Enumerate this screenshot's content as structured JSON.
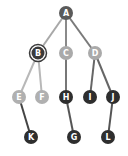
{
  "diagram": {
    "type": "tree",
    "nodes": [
      {
        "id": "A",
        "label": "A",
        "x": 66,
        "y": 13,
        "fill": "#5a5a5a",
        "ring": false
      },
      {
        "id": "B",
        "label": "B",
        "x": 38,
        "y": 53,
        "fill": "#3a3a3a",
        "ring": true
      },
      {
        "id": "C",
        "label": "C",
        "x": 66,
        "y": 53,
        "fill": "#aaaaaa",
        "ring": false
      },
      {
        "id": "D",
        "label": "D",
        "x": 95,
        "y": 53,
        "fill": "#aaaaaa",
        "ring": false
      },
      {
        "id": "E",
        "label": "E",
        "x": 19,
        "y": 97,
        "fill": "#b0b0b0",
        "ring": false
      },
      {
        "id": "F",
        "label": "F",
        "x": 42,
        "y": 97,
        "fill": "#b0b0b0",
        "ring": false
      },
      {
        "id": "H",
        "label": "H",
        "x": 66,
        "y": 97,
        "fill": "#2e2e2e",
        "ring": false
      },
      {
        "id": "I",
        "label": "I",
        "x": 90,
        "y": 97,
        "fill": "#2e2e2e",
        "ring": false
      },
      {
        "id": "J",
        "label": "J",
        "x": 113,
        "y": 97,
        "fill": "#2e2e2e",
        "ring": false
      },
      {
        "id": "K",
        "label": "K",
        "x": 31,
        "y": 137,
        "fill": "#2e2e2e",
        "ring": false
      },
      {
        "id": "G",
        "label": "G",
        "x": 74,
        "y": 137,
        "fill": "#2e2e2e",
        "ring": false
      },
      {
        "id": "L",
        "label": "L",
        "x": 108,
        "y": 137,
        "fill": "#2e2e2e",
        "ring": false
      }
    ],
    "edges": [
      {
        "from": "A",
        "to": "B",
        "color": "#a8a8a8"
      },
      {
        "from": "A",
        "to": "C",
        "color": "#8a8a8a"
      },
      {
        "from": "A",
        "to": "D",
        "color": "#7a7a7a"
      },
      {
        "from": "B",
        "to": "E",
        "color": "#b8b8b8"
      },
      {
        "from": "B",
        "to": "F",
        "color": "#b8b8b8"
      },
      {
        "from": "C",
        "to": "H",
        "color": "#777777"
      },
      {
        "from": "D",
        "to": "I",
        "color": "#666666"
      },
      {
        "from": "D",
        "to": "J",
        "color": "#666666"
      },
      {
        "from": "E",
        "to": "K",
        "color": "#444444"
      },
      {
        "from": "H",
        "to": "G",
        "color": "#555555"
      },
      {
        "from": "J",
        "to": "L",
        "color": "#555555"
      }
    ]
  }
}
